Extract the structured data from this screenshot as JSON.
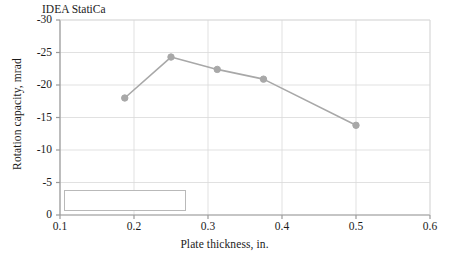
{
  "chart_data": {
    "type": "line",
    "title": "",
    "xlabel": "Plate thickness, in.",
    "ylabel": "Rotation capacity, mrad",
    "xlim": [
      0.1,
      0.6
    ],
    "ylim": [
      0,
      -30
    ],
    "y_inverted": true,
    "grid": true,
    "legend_position": "lower-left-inside",
    "xticks": [
      "0.1",
      "0.2",
      "0.3",
      "0.4",
      "0.5",
      "0.6"
    ],
    "xtick_values": [
      0.1,
      0.2,
      0.3,
      0.4,
      0.5,
      0.6
    ],
    "yticks": [
      "-30",
      "-25",
      "-20",
      "-15",
      "-10",
      "-5",
      "0"
    ],
    "ytick_values": [
      -30,
      -25,
      -20,
      -15,
      -10,
      -5,
      0
    ],
    "series": [
      {
        "name": "IDEA StatiCa",
        "color": "#a8a8a8",
        "marker": "circle",
        "x": [
          0.1875,
          0.25,
          0.3125,
          0.375,
          0.5
        ],
        "values": [
          -18.0,
          -24.3,
          -22.4,
          -20.9,
          -13.8
        ]
      }
    ]
  },
  "legend": {
    "entries": [
      {
        "label": "IDEA StatiCa",
        "color": "#a8a8a8"
      }
    ]
  },
  "colors": {
    "series": "#a8a8a8",
    "grid": "#d9d9d9",
    "axis": "#9a9a9a",
    "text": "#1b1b1b",
    "background": "#ffffff"
  }
}
